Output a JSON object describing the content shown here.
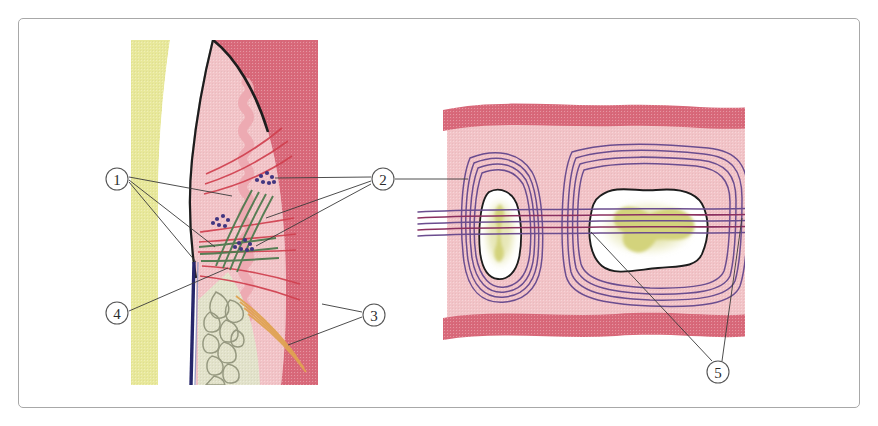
{
  "figure": {
    "frame_color": "#a8a8a8",
    "background_color": "#ffffff"
  },
  "panels": [
    {
      "id": "left-panel",
      "name": "sagittal-section-panel",
      "description": "Sagittal section through tooth, gingiva, periodontal ligament and alveolar bone"
    },
    {
      "id": "right-panel",
      "name": "root-cross-section-panel",
      "description": "Horizontal cross-section through two roots showing pulp canals"
    }
  ],
  "callouts": [
    {
      "id": "1",
      "label": "1",
      "cx": 117,
      "cy": 179,
      "r": 11,
      "panel": "left-panel",
      "leaders": [
        {
          "x1": 129,
          "y1": 177,
          "x2": 232,
          "y2": 196
        },
        {
          "x1": 129,
          "y1": 180,
          "x2": 215,
          "y2": 247
        },
        {
          "x1": 129,
          "y1": 182,
          "x2": 196,
          "y2": 262
        }
      ]
    },
    {
      "id": "2",
      "label": "2",
      "cx": 383,
      "cy": 179,
      "r": 11,
      "panel": "left-panel",
      "leaders": [
        {
          "x1": 371,
          "y1": 177,
          "x2": 275,
          "y2": 178
        },
        {
          "x1": 371,
          "y1": 181,
          "x2": 266,
          "y2": 218
        },
        {
          "x1": 371,
          "y1": 184,
          "x2": 256,
          "y2": 246
        }
      ]
    },
    {
      "id": "3",
      "label": "3",
      "cx": 374,
      "cy": 315,
      "r": 11,
      "panel": "left-panel",
      "leaders": [
        {
          "x1": 362,
          "y1": 312,
          "x2": 322,
          "y2": 304
        },
        {
          "x1": 362,
          "y1": 317,
          "x2": 288,
          "y2": 345
        }
      ]
    },
    {
      "id": "4",
      "label": "4",
      "cx": 117,
      "cy": 313,
      "r": 11,
      "panel": "left-panel",
      "leaders": [
        {
          "x1": 129,
          "y1": 311,
          "x2": 228,
          "y2": 268
        }
      ]
    },
    {
      "id": "5",
      "label": "5",
      "cx": 718,
      "cy": 372,
      "r": 11,
      "panel": "right-panel",
      "leaders": [
        {
          "x1": 712,
          "y1": 361,
          "x2": 591,
          "y2": 232
        },
        {
          "x1": 722,
          "y1": 361,
          "x2": 742,
          "y2": 218
        }
      ]
    },
    {
      "id": "2-bridge",
      "label": "",
      "panel": "right-panel",
      "leaders": [
        {
          "x1": 395,
          "y1": 179,
          "x2": 468,
          "y2": 179
        }
      ]
    }
  ],
  "palette": {
    "dentin_yellow": "#e8e89a",
    "enamel_white": "#ffffff",
    "gingiva_light": "#f0b8be",
    "gingiva_dark": "#d9697a",
    "gingiva_mid": "#edaab2",
    "connective_pink": "#f2c3c7",
    "bone_cream": "#e2e2ca",
    "trabecula_gray": "#8e9178",
    "vessel_red": "#d0404f",
    "fiber_green": "#4e7a4e",
    "fiber_orange": "#e0a352",
    "pdl_navy": "#27276b",
    "infiltrate_blue": "#413680",
    "purple_fiber": "#6b4d8f",
    "magenta_fiber": "#8b3060",
    "pulp_olive": "#d3d37c",
    "outline_dark": "#1d1d1d",
    "leader_line": "#3a3a3a",
    "callout_ring": "#555555"
  }
}
